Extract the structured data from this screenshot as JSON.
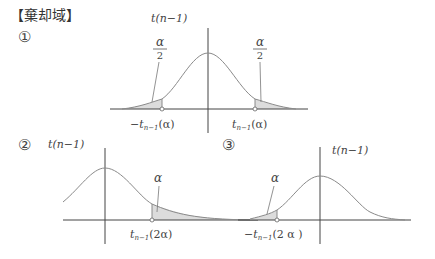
{
  "title": "【棄却域】",
  "colors": {
    "curve": "#8a8a8a",
    "axis": "#444444",
    "shade": "#dcdcdc",
    "text": "#444444"
  },
  "panels": [
    {
      "id": "1",
      "marker": "①",
      "type": "two-sided",
      "axis_label": "t(n−1)",
      "region_label_left": "α/2",
      "region_label_right": "α/2",
      "critical_left": "−t",
      "critical_left_sub": "n−1",
      "critical_left_arg": "(α)",
      "critical_right": "t",
      "critical_right_sub": "n−1",
      "critical_right_arg": "(α)",
      "alpha": "α",
      "alpha_den": "2"
    },
    {
      "id": "2",
      "marker": "②",
      "type": "right-tailed",
      "axis_label": "t(n−1)",
      "region_label": "α",
      "critical": "t",
      "critical_sub": "n−1",
      "critical_arg": "(2α)"
    },
    {
      "id": "3",
      "marker": "③",
      "type": "left-tailed",
      "axis_label": "t(n−1)",
      "region_label": "α",
      "critical": "−t",
      "critical_sub": "n−1",
      "critical_arg": "(2 α )"
    }
  ]
}
